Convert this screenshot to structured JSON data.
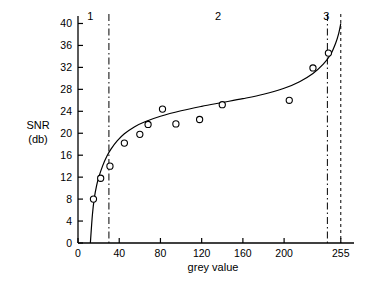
{
  "chart_data": {
    "type": "line",
    "title": "",
    "subtitle": "",
    "xlabel": "grey value",
    "ylabel": "SNR",
    "ylabel_unit": "(db)",
    "xlim": [
      0,
      262
    ],
    "ylim": [
      0,
      41
    ],
    "x_ticks": [
      0,
      40,
      80,
      120,
      160,
      200,
      255
    ],
    "x_tick_labels": [
      "0",
      "40",
      "80",
      "120",
      "160",
      "200",
      "255"
    ],
    "y_ticks": [
      0,
      4,
      8,
      12,
      16,
      20,
      24,
      28,
      32,
      36,
      40
    ],
    "y_tick_labels": [
      "0",
      "4",
      "8",
      "12",
      "16",
      "20",
      "24",
      "28",
      "32",
      "36",
      "40"
    ],
    "grid": false,
    "legend": "none",
    "series": [
      {
        "name": "SNR measurements",
        "marker": "open-circle",
        "x": [
          15,
          22,
          31,
          45,
          60,
          68,
          82,
          95,
          118,
          140,
          205,
          228,
          243
        ],
        "values": [
          8.0,
          11.8,
          14.0,
          18.2,
          19.8,
          21.6,
          24.4,
          21.7,
          22.5,
          25.2,
          26.0,
          31.9,
          34.6
        ]
      },
      {
        "name": "fitted curve",
        "marker": "none",
        "x": [
          12,
          14,
          16,
          18,
          20,
          24,
          28,
          32,
          38,
          45,
          55,
          65,
          80,
          100,
          120,
          140,
          160,
          180,
          200,
          215,
          228,
          238,
          245,
          250,
          253,
          255
        ],
        "values": [
          0.0,
          5.2,
          8.4,
          10.4,
          11.9,
          14.1,
          15.8,
          17.1,
          18.6,
          19.9,
          21.2,
          22.1,
          23.1,
          24.1,
          24.9,
          25.6,
          26.3,
          27.1,
          28.2,
          29.4,
          30.9,
          32.6,
          34.3,
          36.4,
          38.2,
          40.0
        ]
      }
    ],
    "regions": [
      {
        "label": "1",
        "from": 0,
        "to": 30
      },
      {
        "label": "2",
        "from": 30,
        "to": 242
      },
      {
        "label": "3",
        "from": 242,
        "to": 255
      }
    ],
    "vlines": [
      {
        "at": 30,
        "style": "dash-dot"
      },
      {
        "at": 242,
        "style": "dash-dot"
      },
      {
        "at": 255,
        "style": "dashed"
      }
    ],
    "colors": {
      "ink": "#000000",
      "background": "#ffffff"
    }
  }
}
